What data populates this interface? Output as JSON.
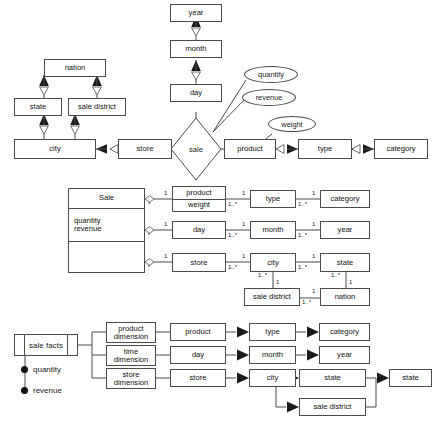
{
  "figure": {
    "line_color": "#4a4a4a",
    "fill_color": "#ffffff",
    "text_color": "#111111"
  },
  "er_diagram": {
    "entities": [
      {
        "id": "nation",
        "label": "nation"
      },
      {
        "id": "state",
        "label": "state"
      },
      {
        "id": "sale_district",
        "label": "sale district"
      },
      {
        "id": "city",
        "label": "city"
      },
      {
        "id": "store",
        "label": "store"
      },
      {
        "id": "year",
        "label": "year"
      },
      {
        "id": "month",
        "label": "month"
      },
      {
        "id": "day",
        "label": "day"
      },
      {
        "id": "product",
        "label": "product"
      },
      {
        "id": "type",
        "label": "type"
      },
      {
        "id": "category",
        "label": "category"
      }
    ],
    "relationship": {
      "id": "sale",
      "label": "sale"
    },
    "attributes": [
      {
        "id": "quantity",
        "label": "quantity",
        "owner": "sale"
      },
      {
        "id": "revenue",
        "label": "revenue",
        "owner": "sale"
      },
      {
        "id": "weight",
        "label": "weight",
        "owner": "product"
      }
    ],
    "edges": [
      {
        "from": "state",
        "to": "nation"
      },
      {
        "from": "sale_district",
        "to": "nation"
      },
      {
        "from": "city",
        "to": "state"
      },
      {
        "from": "city",
        "to": "sale_district"
      },
      {
        "from": "store",
        "to": "city"
      },
      {
        "from": "day",
        "to": "month"
      },
      {
        "from": "month",
        "to": "year"
      },
      {
        "from": "product",
        "to": "type"
      },
      {
        "from": "type",
        "to": "category"
      },
      {
        "from": "store",
        "to": "sale"
      },
      {
        "from": "sale",
        "to": "product"
      },
      {
        "from": "day",
        "to": "sale"
      }
    ]
  },
  "class_diagram": {
    "sale_class": {
      "name": "Sale",
      "attributes": "quantity\nrevenue",
      "operations": ""
    },
    "classes": [
      {
        "id": "product",
        "name": "product",
        "attributes": "weight"
      },
      {
        "id": "type",
        "name": "type"
      },
      {
        "id": "category",
        "name": "category"
      },
      {
        "id": "day",
        "name": "day"
      },
      {
        "id": "month",
        "name": "month"
      },
      {
        "id": "year",
        "name": "year"
      },
      {
        "id": "store",
        "name": "store"
      },
      {
        "id": "city",
        "name": "city"
      },
      {
        "id": "state",
        "name": "state"
      },
      {
        "id": "sale_district",
        "name": "sale district"
      },
      {
        "id": "nation",
        "name": "nation"
      }
    ],
    "multiplicity_one": "1",
    "multiplicity_many": "1..*",
    "aggregation_many": "*",
    "aggregation_one": "1"
  },
  "dimensional_model": {
    "fact": {
      "label": "sale facts"
    },
    "measures": [
      {
        "label": "quantity"
      },
      {
        "label": "revenue"
      }
    ],
    "dimensions": [
      {
        "id": "product_dimension",
        "label": "product\ndimension",
        "levels": [
          {
            "label": "product"
          },
          {
            "label": "type"
          },
          {
            "label": "category"
          }
        ]
      },
      {
        "id": "time_dimension",
        "label": "time\ndimension",
        "levels": [
          {
            "label": "day"
          },
          {
            "label": "month"
          },
          {
            "label": "year"
          }
        ]
      },
      {
        "id": "store_dimension",
        "label": "store\ndimension",
        "levels": [
          {
            "label": "store"
          },
          {
            "label": "city"
          },
          {
            "label": "state"
          },
          {
            "label": "sale district"
          },
          {
            "label": "state"
          }
        ]
      }
    ]
  }
}
